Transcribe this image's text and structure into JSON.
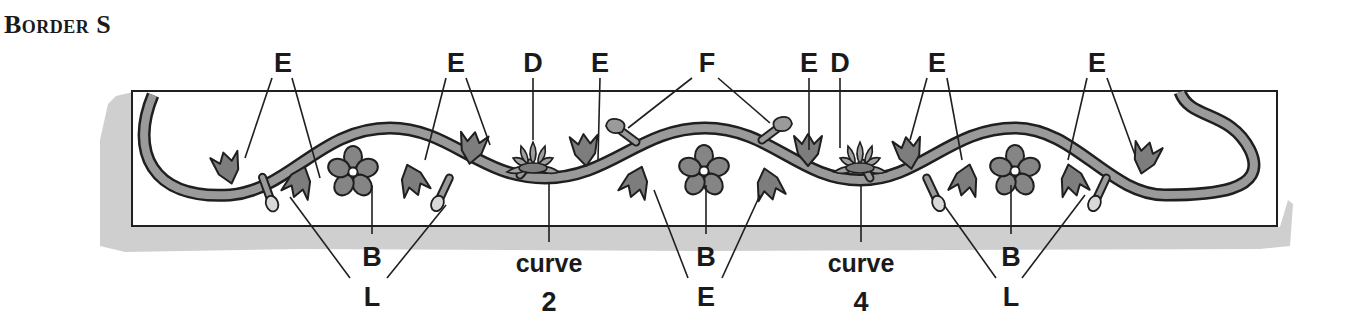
{
  "title": "Border S",
  "colors": {
    "outline": "#1f1f1f",
    "stem_fill": "#9a9a9a",
    "leaf_fill": "#7d7d7d",
    "flower_fill": "#858585",
    "bud_fill": "#d9d9d9",
    "shadow": "#cfcfcf",
    "panel": "#ffffff"
  },
  "labels": {
    "top": [
      {
        "text": "E",
        "x": 283
      },
      {
        "text": "E",
        "x": 456
      },
      {
        "text": "D",
        "x": 533
      },
      {
        "text": "E",
        "x": 600
      },
      {
        "text": "F",
        "x": 707
      },
      {
        "text": "E",
        "x": 809
      },
      {
        "text": "D",
        "x": 840
      },
      {
        "text": "E",
        "x": 937
      },
      {
        "text": "E",
        "x": 1097
      }
    ],
    "bottom_row1": [
      {
        "text": "B",
        "x": 372
      },
      {
        "text": "curve",
        "x": 549
      },
      {
        "text": "B",
        "x": 706
      },
      {
        "text": "curve",
        "x": 861
      },
      {
        "text": "B",
        "x": 1011
      }
    ],
    "bottom_row2": [
      {
        "text": "L",
        "x": 372
      },
      {
        "text": "2",
        "x": 549
      },
      {
        "text": "E",
        "x": 706
      },
      {
        "text": "4",
        "x": 861
      },
      {
        "text": "L",
        "x": 1011
      }
    ]
  },
  "legend": {
    "B": "five-petal flower",
    "D": "lotus flower",
    "E": "tulip leaf",
    "F": "bud",
    "L": "bud on stalk",
    "curve": "stem curve"
  }
}
